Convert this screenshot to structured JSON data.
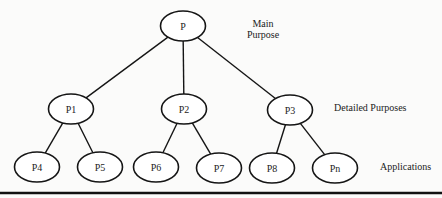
{
  "diagram": {
    "type": "tree",
    "levels": [
      {
        "name": "main",
        "label_lines": [
          "Main",
          "Purpose"
        ]
      },
      {
        "name": "detailed",
        "label_lines": [
          "Detailed Purposes"
        ]
      },
      {
        "name": "applications",
        "label_lines": [
          "Applications"
        ]
      }
    ],
    "nodes": [
      {
        "id": "P",
        "label": "P",
        "level": 0,
        "parent": null
      },
      {
        "id": "P1",
        "label": "P1",
        "level": 1,
        "parent": "P"
      },
      {
        "id": "P2",
        "label": "P2",
        "level": 1,
        "parent": "P"
      },
      {
        "id": "P3",
        "label": "P3",
        "level": 1,
        "parent": "P"
      },
      {
        "id": "P4",
        "label": "P4",
        "level": 2,
        "parent": "P1"
      },
      {
        "id": "P5",
        "label": "P5",
        "level": 2,
        "parent": "P1"
      },
      {
        "id": "P6",
        "label": "P6",
        "level": 2,
        "parent": "P2"
      },
      {
        "id": "P7",
        "label": "P7",
        "level": 2,
        "parent": "P2"
      },
      {
        "id": "P8",
        "label": "P8",
        "level": 2,
        "parent": "P3"
      },
      {
        "id": "Pn",
        "label": "Pn",
        "level": 2,
        "parent": "P3"
      }
    ],
    "colors": {
      "stroke": "#151515",
      "text": "#222222",
      "background": "#fbfbfa"
    }
  }
}
